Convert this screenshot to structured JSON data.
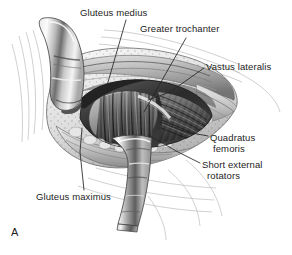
{
  "figure": {
    "panel_letter": "A",
    "style": "grayscale medical line-and-wash illustration",
    "background_color": "#ffffff",
    "ink_color": "#1d1d1d"
  },
  "labels": [
    {
      "id": "gluteus-medius",
      "text": "Gluteus medius",
      "x": 80,
      "y": 7
    },
    {
      "id": "greater-trochanter",
      "text": "Greater trochanter",
      "x": 140,
      "y": 23
    },
    {
      "id": "vastus-lateralis",
      "text": "Vastus lateralis",
      "x": 206,
      "y": 61
    },
    {
      "id": "quadratus-femoris-1",
      "text": "Quadratus",
      "x": 210,
      "y": 132
    },
    {
      "id": "quadratus-femoris-2",
      "text": "femoris",
      "x": 213,
      "y": 143
    },
    {
      "id": "short-external-1",
      "text": "Short external",
      "x": 202,
      "y": 159
    },
    {
      "id": "short-external-2",
      "text": "rotators",
      "x": 207,
      "y": 170
    },
    {
      "id": "gluteus-maximus",
      "text": "Gluteus maximus",
      "x": 36,
      "y": 191
    }
  ],
  "anatomy": {
    "structures": [
      "Gluteus medius",
      "Greater trochanter",
      "Vastus lateralis",
      "Quadratus femoris",
      "Short external rotators",
      "Gluteus maximus"
    ],
    "instruments": [
      {
        "name": "superior-retractor",
        "description": "curved metallic retractor blade, upper left"
      },
      {
        "name": "inferior-retractor",
        "description": "straight metallic retractor band, lower center"
      }
    ]
  },
  "colors": {
    "ink": "#1d1d1d",
    "leader_line": "#262626",
    "tissue_mid": "#9a9a9a",
    "tissue_dark": "#3a3a3a",
    "tissue_light": "#d8d8d8",
    "metal_light": "#f2f2f2",
    "metal_mid": "#b4b4b4",
    "metal_dark": "#4a4a4a",
    "skin_contour": "#b9b9b9",
    "background": "#ffffff"
  }
}
